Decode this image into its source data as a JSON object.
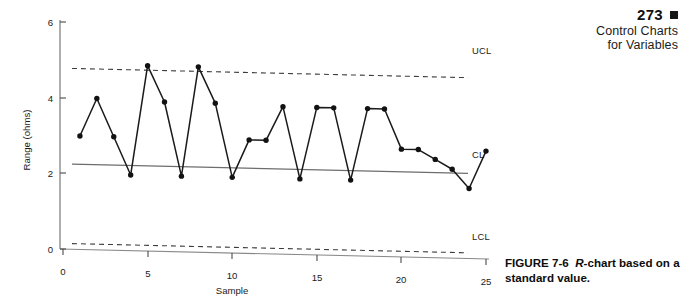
{
  "page_header": {
    "page_number": "273",
    "marker_icon": "filled-square-icon",
    "line1": "Control Charts",
    "line2": "for Variables"
  },
  "figure_caption": {
    "prefix": "FIGURE 7-6",
    "italic_part": "R",
    "rest": "-chart based on a standard value."
  },
  "chart_data": {
    "type": "line",
    "title": "",
    "subtitle": "",
    "xlabel": "Sample",
    "ylabel": "Range (ohms)",
    "xlim": [
      0,
      25
    ],
    "ylim": [
      0,
      6
    ],
    "xticks": [
      0,
      5,
      10,
      15,
      20,
      25
    ],
    "xtick_labels": [
      "0",
      "5",
      "10",
      "15",
      "20",
      "25"
    ],
    "yticks": [
      0,
      2,
      4,
      6
    ],
    "ytick_labels": [
      "0",
      "2",
      "4",
      "6"
    ],
    "grid": false,
    "legend": "none",
    "marker": "filled-circle",
    "x": [
      1,
      2,
      3,
      4,
      5,
      6,
      7,
      8,
      9,
      10,
      11,
      12,
      13,
      14,
      15,
      16,
      17,
      18,
      19,
      20,
      21,
      22,
      23,
      24,
      25
    ],
    "values": [
      3.0,
      4.0,
      3.0,
      2.0,
      4.9,
      3.95,
      2.0,
      4.9,
      3.95,
      2.0,
      3.0,
      3.0,
      3.9,
      2.0,
      3.9,
      3.9,
      2.0,
      3.9,
      3.9,
      2.85,
      2.85,
      2.6,
      2.35,
      1.85,
      2.85
    ],
    "series": [
      {
        "name": "Range",
        "values": [
          3.0,
          4.0,
          3.0,
          2.0,
          4.9,
          3.95,
          2.0,
          4.9,
          3.95,
          2.0,
          3.0,
          3.0,
          3.9,
          2.0,
          3.9,
          3.9,
          2.0,
          3.9,
          3.9,
          2.85,
          2.85,
          2.6,
          2.35,
          1.85,
          2.85
        ]
      }
    ],
    "control_limits": [
      {
        "name": "UCL",
        "label": "UCL",
        "value": 4.78,
        "style": "dashed"
      },
      {
        "name": "CL",
        "label": "CL",
        "value": 2.25,
        "style": "solid"
      },
      {
        "name": "LCL",
        "label": "LCL",
        "value": 0.15,
        "style": "dashed"
      }
    ],
    "annotations": [
      "UCL",
      "CL",
      "LCL"
    ]
  },
  "colors": {
    "ink": "#111111",
    "axis": "#6f6f6f",
    "line": "#1a1a1a",
    "limit": "#444444"
  }
}
